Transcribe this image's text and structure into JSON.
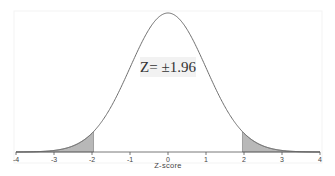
{
  "chart_data": {
    "type": "area",
    "title": "",
    "xlabel": "Z-score",
    "ylabel": "",
    "xlim": [
      -4,
      4
    ],
    "x_ticks": [
      -4,
      -3,
      -2,
      -1,
      0,
      1,
      2,
      3,
      4
    ],
    "x_tick_labels": [
      "-4",
      "-3",
      "-2",
      "-1",
      "0",
      "1",
      "2",
      "3",
      "4"
    ],
    "grid": false,
    "legend": null,
    "series": [
      {
        "name": "Standard normal density",
        "distribution": "normal",
        "mean": 0,
        "sd": 1,
        "x": [
          -4,
          -3,
          -2,
          -1.96,
          -1,
          0,
          1,
          1.96,
          2,
          3,
          4
        ],
        "y": [
          0.0001,
          0.0044,
          0.054,
          0.0584,
          0.242,
          0.3989,
          0.242,
          0.0584,
          0.054,
          0.0044,
          0.0001
        ]
      }
    ],
    "shaded_regions": [
      {
        "from": -4,
        "to": -1.96,
        "label": "lower tail (2.5%)"
      },
      {
        "from": 1.96,
        "to": 4,
        "label": "upper tail (2.5%)"
      }
    ],
    "annotations": [
      {
        "text": "Z= ±1.96",
        "x": 0,
        "y_frac": 0.62
      }
    ],
    "colors": {
      "curve": "#6e6e6e",
      "shade": "#b8b8b8",
      "axis": "#555555",
      "annot_bg": "#f2f2f2"
    }
  }
}
